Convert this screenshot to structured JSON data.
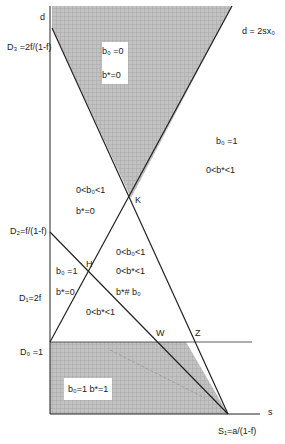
{
  "diagram": {
    "axes": {
      "y_label": "d",
      "x_label": "s"
    },
    "y_ticks": [
      {
        "id": "D3",
        "label": "D₃ =2f/(1-f)"
      },
      {
        "id": "D2",
        "label": "D₂=f/(1-f)"
      },
      {
        "id": "D1",
        "label": "D₁=2f"
      },
      {
        "id": "D0",
        "label": "D₀ =1"
      }
    ],
    "x_ticks": [
      {
        "id": "S1",
        "label": "S₁=a/(1-f)"
      }
    ],
    "line_labels": {
      "upper_line": "d = 2sx₀"
    },
    "points": {
      "K": "K",
      "H": "H",
      "W": "W",
      "Z": "Z"
    },
    "regions": {
      "top_shaded": {
        "line1": "b₀ =0",
        "line2": "b*=0"
      },
      "right": {
        "line1": "b₀ =1",
        "line2": "0<b*<1"
      },
      "left_middle": {
        "line1": "0<b₀<1",
        "line2": "b*=0"
      },
      "center": {
        "line1": "0<b₀<1",
        "line2": "0<b*<1",
        "line3": "b*# b₀"
      },
      "left_lower": {
        "line1": "b₀ =1",
        "line2": "b*=0"
      },
      "bottom_triangle": {
        "line1": "0<b*<1"
      },
      "bottom_shaded": {
        "line1": "b₀=1 b*=1"
      }
    },
    "colors": {
      "line": "#222222",
      "shade": "#b9b9b9"
    }
  }
}
